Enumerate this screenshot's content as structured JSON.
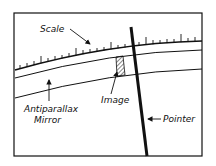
{
  "diagram": {
    "labels": {
      "scale": "Scale",
      "mirror_line1": "Antiparallax",
      "mirror_line2": "Mirror",
      "image": "Image",
      "pointer": "Pointer"
    },
    "colors": {
      "ink": "#111111",
      "background": "#ffffff"
    }
  }
}
